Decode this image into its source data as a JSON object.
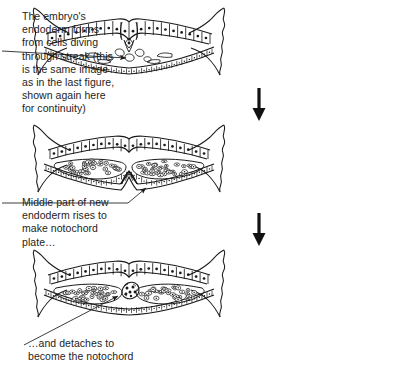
{
  "figure": {
    "background_color": "#ffffff",
    "ink_color": "#1a1a1a"
  },
  "captions": [
    {
      "id": "caption-1",
      "text": "The embryo's\nendoderm forms\nfrom cells diving\nthrough streak (this\nis the same image\nas in the last figure,\nshown again here\nfor continuity)",
      "points_to": "primitive-streak-panel-1"
    },
    {
      "id": "caption-2",
      "text": "Middle part of new\nendoderm rises to\nmake notochord\nplate…",
      "points_to": "notochord-plate-panel-2"
    },
    {
      "id": "caption-3",
      "text": "…and detaches to\nbecome the notochord",
      "points_to": "notochord-panel-3"
    }
  ],
  "panels": [
    {
      "id": "panel-1",
      "label": "embryo-cross-section-streak",
      "stage": "Endoderm forming by ingression through the primitive streak",
      "features": [
        "ectoderm",
        "primitive-streak",
        "ingressing-cells",
        "endoderm",
        "lateral-membrane"
      ]
    },
    {
      "id": "panel-2",
      "label": "embryo-cross-section-notochord-plate",
      "stage": "Middle endoderm rises to form notochord plate",
      "features": [
        "ectoderm",
        "mesoderm",
        "endoderm",
        "notochord-plate",
        "lateral-membrane"
      ]
    },
    {
      "id": "panel-3",
      "label": "embryo-cross-section-notochord",
      "stage": "Notochord detached from endoderm",
      "features": [
        "ectoderm",
        "mesoderm",
        "endoderm",
        "notochord",
        "lateral-membrane"
      ]
    }
  ],
  "arrows": [
    {
      "id": "stage-arrow-1",
      "direction": "down",
      "between": [
        "panel-1",
        "panel-2"
      ]
    },
    {
      "id": "stage-arrow-2",
      "direction": "down",
      "between": [
        "panel-2",
        "panel-3"
      ]
    }
  ]
}
